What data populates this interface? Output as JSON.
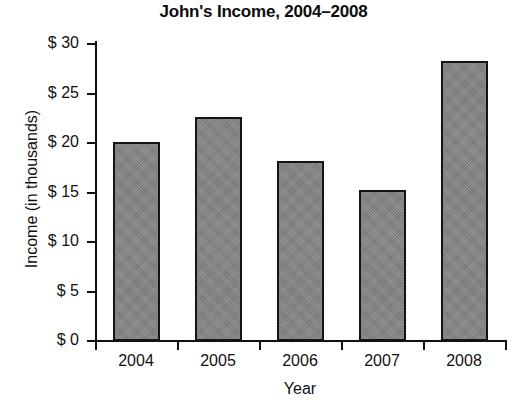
{
  "chart_data": {
    "type": "bar",
    "title": "John's Income, 2004–2008",
    "xlabel": "Year",
    "ylabel": "Income (in thousands)",
    "categories": [
      "2004",
      "2005",
      "2006",
      "2007",
      "2008"
    ],
    "values": [
      20.1,
      22.6,
      18.2,
      15.3,
      28.3
    ],
    "ytick_labels": [
      "$ 30",
      "$ 25",
      "$ 20",
      "$ 15",
      "$ 10",
      "$ 5",
      "$ 0"
    ],
    "ytick_values": [
      30,
      25,
      20,
      15,
      10,
      5,
      0
    ],
    "ylim": [
      0,
      30
    ],
    "grid": false,
    "legend": null,
    "bar_color": "#808080",
    "bar_edge_color": "#141414",
    "axis_color": "#111111",
    "background_color": "#ffffff"
  }
}
